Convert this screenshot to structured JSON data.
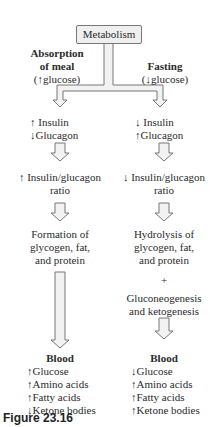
{
  "title": "Metabolism",
  "left": {
    "heading": "Absorption of meal",
    "heading_l1": "Absorption",
    "heading_l2": "of meal",
    "glucose_note": "(↑glucose)",
    "hormones": [
      "↑ Insulin",
      "↓Glucagon"
    ],
    "ratio_l1": "↑ Insulin/glucagon",
    "ratio_l2": "ratio",
    "process": [
      "Formation of",
      "glycogen, fat,",
      "and protein"
    ],
    "blood_heading": "Blood",
    "blood": [
      "↑Glucose",
      "↑Amino acids",
      "↑Fatty acids",
      "↓Ketone bodies"
    ]
  },
  "right": {
    "heading": "Fasting",
    "glucose_note": "(↓glucose)",
    "hormones": [
      "↓ Insulin",
      "↑Glucagon"
    ],
    "ratio_l1": "↓ Insulin/glucagon",
    "ratio_l2": "ratio",
    "process": [
      "Hydrolysis of",
      "glycogen, fat,",
      "and protein"
    ],
    "plus": "+",
    "process2": [
      "Gluconeogenesis",
      "and ketogenesis"
    ],
    "blood_heading": "Blood",
    "blood": [
      "↓Glucose",
      "↑Amino acids",
      "↑Fatty acids",
      "↑Ketone bodies"
    ]
  },
  "figure_label": "Figure 23.16"
}
